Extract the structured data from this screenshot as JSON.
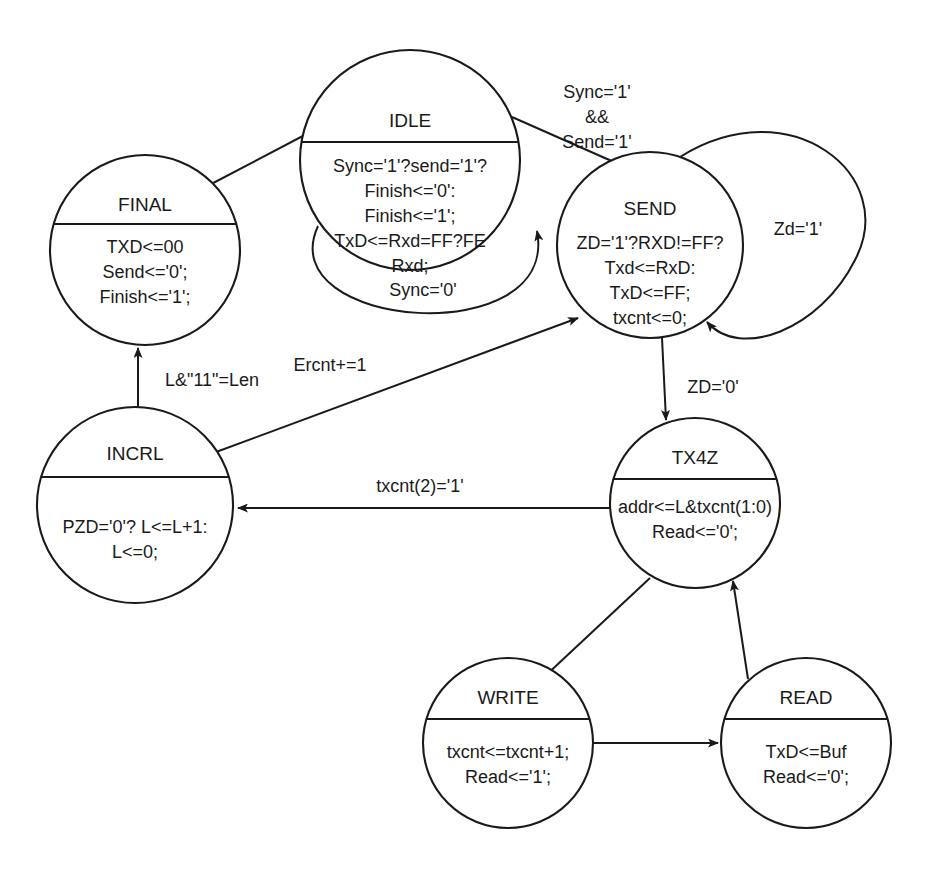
{
  "diagram": {
    "type": "finite-state-machine",
    "title": "",
    "stroke_color": "#1a1a1a",
    "background_color": "#ffffff",
    "states": [
      {
        "id": "idle",
        "name": "IDLE",
        "cx": 410,
        "cy": 160,
        "r": 110,
        "divider_y": 92,
        "title_y": 72,
        "body": [
          "Sync='1'?send='1'?",
          "Finish<='0':",
          "Finish<='1';",
          "TxD<=Rxd=FF?FE",
          "Rxd;"
        ],
        "body_start_y": 122,
        "line_height": 25
      },
      {
        "id": "final",
        "name": "FINAL",
        "cx": 145,
        "cy": 250,
        "r": 95,
        "divider_y": 69,
        "title_y": 51,
        "body": [
          "TXD<=00",
          "Send<='0';",
          "Finish<='1';"
        ],
        "body_start_y": 98,
        "line_height": 25
      },
      {
        "id": "send",
        "name": "SEND",
        "cx": 650,
        "cy": 245,
        "r": 93,
        "divider_y": null,
        "title_y": 58,
        "body": [
          "ZD='1'?RXD!=FF?",
          "Txd<=RxD:",
          "TxD<=FF;",
          "txcnt<=0;"
        ],
        "body_start_y": 97,
        "line_height": 25
      },
      {
        "id": "incrl",
        "name": "INCRL",
        "cx": 135,
        "cy": 505,
        "r": 98,
        "divider_y": 70,
        "title_y": 48,
        "body": [
          "PZD='0'? L<=L+1:",
          "L<=0;"
        ],
        "body_start_y": 126,
        "line_height": 25
      },
      {
        "id": "tx4z",
        "name": "TX4Z",
        "cx": 695,
        "cy": 503,
        "r": 85,
        "divider_y": 61,
        "title_y": 41,
        "body": [
          "addr<=L&txcnt(1:0)",
          "Read<='0';"
        ],
        "body_start_y": 95,
        "line_height": 25
      },
      {
        "id": "write",
        "name": "WRITE",
        "cx": 508,
        "cy": 743,
        "r": 85,
        "divider_y": 61,
        "title_y": 41,
        "body": [
          "txcnt<=txcnt+1;",
          "Read<='1';"
        ],
        "body_start_y": 100,
        "line_height": 25
      },
      {
        "id": "read",
        "name": "READ",
        "cx": 806,
        "cy": 743,
        "r": 85,
        "divider_y": 61,
        "title_y": 41,
        "body": [
          "TxD<=Buf",
          "Read<='0';"
        ],
        "body_start_y": 100,
        "line_height": 25
      }
    ],
    "transitions": [
      {
        "id": "final-to-idle",
        "from": "FINAL",
        "to": "IDLE",
        "label": "",
        "path": "M 196 192 L 318 128",
        "label_x": null,
        "label_y": null
      },
      {
        "id": "idle-to-send",
        "from": "IDLE",
        "to": "SEND",
        "label": "Sync='1'\n&&\nSend='1'",
        "label_lines": [
          "Sync='1'",
          "&&",
          "Send='1'"
        ],
        "path": "M 512 117 L 632 170",
        "label_x": 597,
        "label_y": 98,
        "line_height": 25
      },
      {
        "id": "idle-self-sync0",
        "from": "IDLE",
        "to": "IDLE",
        "label": "Sync='0'",
        "path": "M 318 226 C 270 330, 560 352, 537 231",
        "label_x": 423,
        "label_y": 296
      },
      {
        "id": "send-self-zd1",
        "from": "SEND",
        "to": "SEND",
        "label": "Zd='1'",
        "path": "M 680 157 C 790 88, 900 175, 855 260 C 820 330, 740 360, 707 322",
        "label_x": 798,
        "label_y": 235
      },
      {
        "id": "incrl-to-final",
        "from": "INCRL",
        "to": "FINAL",
        "label": "L&\"11\"=Len",
        "path": "M 138 407 L 138 348",
        "label_x": 212,
        "label_y": 386
      },
      {
        "id": "incrl-to-send",
        "from": "INCRL",
        "to": "SEND",
        "label": "Ercnt+=1",
        "path": "M 208 455 L 578 318",
        "label_x": 330,
        "label_y": 371
      },
      {
        "id": "send-to-tx4z",
        "from": "SEND",
        "to": "TX4Z",
        "label": "ZD='0'",
        "path": "M 662 338 L 666 420",
        "label_x": 713,
        "label_y": 393
      },
      {
        "id": "tx4z-to-incrl",
        "from": "TX4Z",
        "to": "INCRL",
        "label": "txcnt(2)='1'",
        "path": "M 612 508 L 238 508",
        "label_x": 420,
        "label_y": 492
      },
      {
        "id": "tx4z-to-write",
        "from": "TX4Z",
        "to": "WRITE",
        "label": "",
        "path": "M 650 578 L 543 678"
      },
      {
        "id": "write-to-read",
        "from": "WRITE",
        "to": "READ",
        "label": "",
        "path": "M 594 743 L 718 743"
      },
      {
        "id": "read-to-tx4z",
        "from": "READ",
        "to": "TX4Z",
        "label": "",
        "path": "M 748 679 L 733 581"
      }
    ]
  }
}
